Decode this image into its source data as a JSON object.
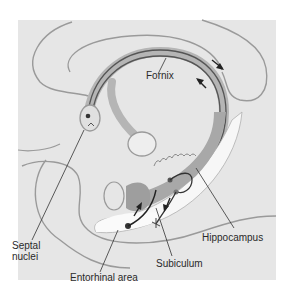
{
  "diagram": {
    "type": "anatomical-illustration",
    "colors": {
      "background_panel": "#e6e6e6",
      "outline": "#9a9a9a",
      "fornix_band": "#b5b5b5",
      "fornix_dark": "#555555",
      "hippocampus_fill": "#a8a8a8",
      "white_strip": "#f7f7f7",
      "neuron_dot": "#333333",
      "arrow": "#222222",
      "label_text": "#2a2a2a"
    },
    "labels": {
      "fornix": "Fornix",
      "septal_nuclei": "Septal\nnuclei",
      "entorhinal_area": "Entorhinal area",
      "subiculum": "Subiculum",
      "hippocampus": "Hippocampus"
    },
    "arrows": [
      {
        "location": "upper-right fornix outer",
        "direction": "down-right"
      },
      {
        "location": "upper-right fornix inner",
        "direction": "up-left"
      },
      {
        "location": "entorhinal to hippocampus",
        "direction": "up"
      },
      {
        "location": "subiculum",
        "direction": "down"
      }
    ]
  }
}
